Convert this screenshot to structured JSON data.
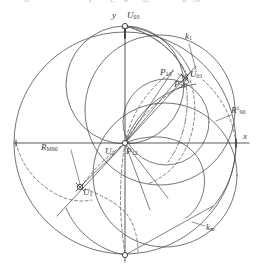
{
  "figure": {
    "type": "geometric-construction-diagram",
    "background": "#ffffff",
    "stroke": "#4a4a4a",
    "axes": {
      "x_label": "x",
      "y_label": "y",
      "origin_px": [
        125,
        143
      ],
      "x_axis_from_px": [
        14,
        143
      ],
      "x_axis_to_px": [
        249,
        143
      ],
      "y_axis_from_px": [
        125,
        26
      ],
      "y_axis_to_px": [
        125,
        262
      ]
    },
    "main_circle": {
      "center_px": [
        125,
        143
      ],
      "radius_px": 111
    },
    "labels": [
      {
        "id": "y-axis-label",
        "text": "y",
        "sub": "",
        "sup": "",
        "x": 114,
        "y": 16
      },
      {
        "id": "U03",
        "text": "U",
        "sub": "03",
        "sup": "",
        "x": 127,
        "y": 16
      },
      {
        "id": "k1",
        "text": "k",
        "sub": "1",
        "sup": "",
        "x": 186,
        "y": 36
      },
      {
        "id": "P13",
        "text": "P",
        "sub": "13",
        "sup": "",
        "x": 163,
        "y": 73
      },
      {
        "id": "U01",
        "text": "U",
        "sub": "01",
        "sup": "",
        "x": 190,
        "y": 74
      },
      {
        "id": "P23",
        "text": "P",
        "sub": "23",
        "sup": "",
        "x": 177,
        "y": 84
      },
      {
        "id": "R1_90",
        "text": "R",
        "sub": "90",
        "sup": "1",
        "x": 233,
        "y": 111
      },
      {
        "id": "x-axis-label",
        "text": "x",
        "sub": "",
        "sup": "",
        "x": 242,
        "y": 136
      },
      {
        "id": "RM90",
        "text": "R",
        "sub": "M90",
        "sup": "",
        "x": 44,
        "y": 148
      },
      {
        "id": "U2",
        "text": "U",
        "sub": "2",
        "sup": "",
        "x": 108,
        "y": 152
      },
      {
        "id": "P12",
        "text": "P",
        "sub": "12",
        "sup": "",
        "x": 128,
        "y": 152
      },
      {
        "id": "U1",
        "text": "U",
        "sub": "1",
        "sup": "",
        "x": 85,
        "y": 191
      },
      {
        "id": "km",
        "text": "k",
        "sub": "m",
        "sup": "",
        "x": 207,
        "y": 227
      }
    ],
    "top_cut_text": [
      {
        "text": "U",
        "x": 24
      },
      {
        "text": "1",
        "x": 88
      },
      {
        "text": "1,",
        "x": 109
      },
      {
        "text": "w",
        "x": 123
      },
      {
        "text": "0,",
        "x": 143
      },
      {
        "text": "u",
        "x": 182
      },
      {
        "text": "90",
        "x": 192
      }
    ],
    "nodes": [
      {
        "id": "node-U03",
        "cx": 125,
        "cy": 26,
        "r": 2.6
      },
      {
        "id": "node-U01",
        "cx": 185,
        "cy": 78,
        "r": 2.6
      },
      {
        "id": "node-P12",
        "cx": 125,
        "cy": 143,
        "r": 2.6
      },
      {
        "id": "node-U1",
        "cx": 80,
        "cy": 187,
        "r": 2.6
      },
      {
        "id": "node-bot",
        "cx": 125,
        "cy": 255,
        "r": 2.6
      }
    ]
  }
}
